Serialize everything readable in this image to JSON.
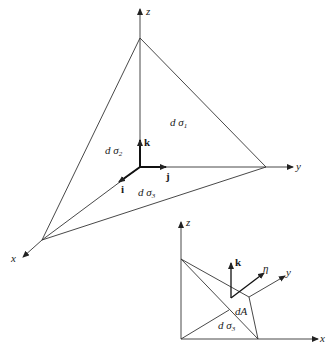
{
  "figure": {
    "main_tetrahedron": {
      "axes": {
        "x": "x",
        "y": "y",
        "z": "z"
      },
      "unit_vectors": {
        "i": "i",
        "j": "j",
        "k": "k"
      },
      "faces": [
        {
          "id": "d_sigma_1",
          "prefix": "d σ",
          "sub": "1"
        },
        {
          "id": "d_sigma_2",
          "prefix": "d σ",
          "sub": "2"
        },
        {
          "id": "d_sigma_3",
          "prefix": "d σ",
          "sub": "3"
        }
      ]
    },
    "inset_tetrahedron": {
      "axes": {
        "x": "x",
        "y": "y",
        "z": "z"
      },
      "unit_vectors": {
        "k": "k",
        "eta": "η"
      },
      "labels": {
        "area": "dA",
        "face_prefix": "d σ",
        "face_sub": "3"
      }
    },
    "colors": {
      "line": "#333333",
      "background": "#ffffff"
    }
  }
}
